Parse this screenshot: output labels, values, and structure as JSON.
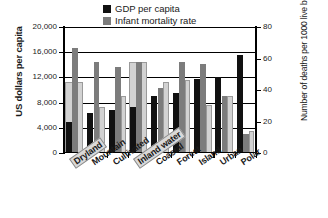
{
  "chart_data": {
    "type": "bar",
    "title": "",
    "xlabel": "",
    "ylabel": "US dollars per capita",
    "y2label": "Number of deaths per 1000 live births",
    "grid": true,
    "legend_position": "top-center",
    "ylim": [
      0,
      20000
    ],
    "y2lim": [
      0,
      80
    ],
    "yticks": [
      "0",
      "4,000",
      "8,000",
      "12,000",
      "16,000",
      "20,000"
    ],
    "y2ticks": [
      "0",
      "20",
      "40",
      "60",
      "80"
    ],
    "categories": [
      "Dryland",
      "Mountain",
      "Cultivated",
      "Inland water",
      "Coastal",
      "Forest",
      "Island",
      "Urban",
      "Polar"
    ],
    "highlighted_categories": [
      "Dryland",
      "Inland water"
    ],
    "series": [
      {
        "name": "GDP per capita",
        "axis": "left",
        "color": "#111111",
        "values": [
          4900,
          6400,
          6800,
          7300,
          9000,
          9500,
          11700,
          12000,
          15500
        ]
      },
      {
        "name": "Infant mortality rate",
        "axis": "right",
        "color": "#7c7c7c",
        "values": [
          66.5,
          58.0,
          54.5,
          58.0,
          41.5,
          58.0,
          56.5,
          36.5,
          12.0
        ]
      },
      {
        "name": "Precip./unit area",
        "axis": "right",
        "color": "#d2d2d2",
        "values": [
          45.0,
          29.5,
          36.0,
          58.0,
          45.0,
          46.5,
          30.5,
          36.5,
          14.0
        ]
      }
    ]
  },
  "legend": {
    "items": [
      {
        "label": "GDP per capita",
        "swatch": "gdp"
      },
      {
        "label": "Infant mortality rate",
        "swatch": "imr"
      },
      {
        "label": "Precip./unit area",
        "swatch": "precip"
      }
    ]
  }
}
